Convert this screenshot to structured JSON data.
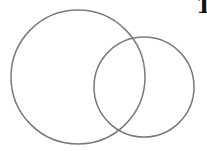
{
  "diagram": {
    "type": "venn",
    "circles": [
      {
        "id": "left",
        "cx": 78,
        "cy": 77,
        "r": 67,
        "stroke": "#7a7a7a"
      },
      {
        "id": "right",
        "cx": 144,
        "cy": 87,
        "r": 50,
        "stroke": "#7a7a7a"
      }
    ],
    "corner_label": "1"
  }
}
